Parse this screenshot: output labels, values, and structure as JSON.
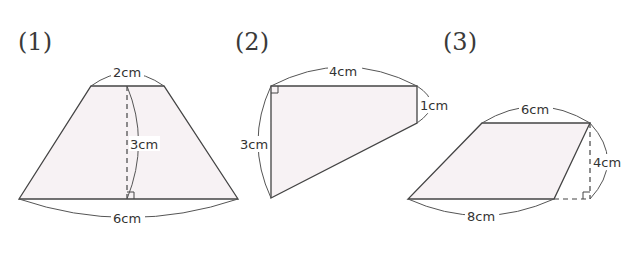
{
  "problems": [
    {
      "label": "(1)",
      "shape": "trapezoid",
      "dimensions": {
        "top": "2cm",
        "height": "3cm",
        "bottom": "6cm"
      }
    },
    {
      "label": "(2)",
      "shape": "right-trapezoid",
      "dimensions": {
        "top": "4cm",
        "right": "1cm",
        "left": "3cm"
      }
    },
    {
      "label": "(3)",
      "shape": "parallelogram-like trapezoid",
      "dimensions": {
        "top": "6cm",
        "height": "4cm",
        "bottom": "8cm"
      }
    }
  ],
  "colors": {
    "fill": "#f7f2f4",
    "stroke": "#444444"
  }
}
